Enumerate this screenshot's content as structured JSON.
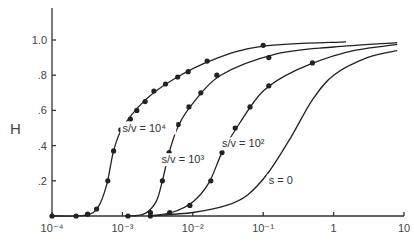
{
  "chart_data": {
    "type": "line",
    "title": "",
    "xlabel": "",
    "ylabel": "H",
    "xscale": "log",
    "xlim": [
      0.0001,
      10
    ],
    "ylim": [
      0,
      1.15
    ],
    "grid": false,
    "legend": "inline curve labels",
    "x_ticks": [
      "10⁻⁴",
      "10⁻³",
      "10⁻²",
      "10⁻¹",
      "1",
      "10"
    ],
    "y_ticks": [
      ".2",
      ".4",
      ".6",
      ".8",
      "1.0"
    ],
    "series": [
      {
        "name": "s/v = 10⁴",
        "label": "s/v = 10⁴",
        "markers": true,
        "points": [
          [
            0.0001,
            0.0
          ],
          [
            0.00022,
            0.0
          ],
          [
            0.00032,
            0.01
          ],
          [
            0.00043,
            0.04
          ],
          [
            0.00062,
            0.2
          ],
          [
            0.00075,
            0.37
          ],
          [
            0.00095,
            0.49
          ],
          [
            0.0013,
            0.55
          ],
          [
            0.0016,
            0.6
          ],
          [
            0.0021,
            0.65
          ],
          [
            0.0028,
            0.71
          ],
          [
            0.0041,
            0.75
          ],
          [
            0.0061,
            0.79
          ],
          [
            0.0086,
            0.82
          ],
          [
            0.016,
            0.88
          ],
          [
            0.1,
            0.97
          ]
        ],
        "line": [
          [
            0.0001,
            0.0
          ],
          [
            0.0003,
            0.005
          ],
          [
            0.00045,
            0.05
          ],
          [
            0.0006,
            0.18
          ],
          [
            0.00075,
            0.37
          ],
          [
            0.001,
            0.5
          ],
          [
            0.002,
            0.65
          ],
          [
            0.005,
            0.77
          ],
          [
            0.02,
            0.89
          ],
          [
            0.1,
            0.965
          ],
          [
            1.5,
            0.99
          ]
        ]
      },
      {
        "name": "s/v = 10³",
        "label": "s/v = 10³",
        "markers": true,
        "points": [
          [
            0.0012,
            0.0
          ],
          [
            0.0025,
            0.02
          ],
          [
            0.0037,
            0.2
          ],
          [
            0.0046,
            0.36
          ],
          [
            0.0062,
            0.52
          ],
          [
            0.0088,
            0.62
          ],
          [
            0.013,
            0.7
          ],
          [
            0.022,
            0.8
          ],
          [
            0.12,
            0.9
          ]
        ],
        "line": [
          [
            0.0011,
            0.0
          ],
          [
            0.002,
            0.01
          ],
          [
            0.003,
            0.08
          ],
          [
            0.0037,
            0.2
          ],
          [
            0.0046,
            0.36
          ],
          [
            0.0062,
            0.51
          ],
          [
            0.01,
            0.64
          ],
          [
            0.025,
            0.8
          ],
          [
            0.15,
            0.92
          ],
          [
            1.0,
            0.96
          ],
          [
            8.0,
            0.985
          ]
        ]
      },
      {
        "name": "s/v = 10²",
        "label": "s/v = 10²",
        "markers": true,
        "points": [
          [
            0.0025,
            0.0
          ],
          [
            0.0047,
            0.02
          ],
          [
            0.0091,
            0.06
          ],
          [
            0.018,
            0.2
          ],
          [
            0.026,
            0.36
          ],
          [
            0.04,
            0.5
          ],
          [
            0.065,
            0.62
          ],
          [
            0.12,
            0.74
          ],
          [
            0.5,
            0.87
          ]
        ],
        "line": [
          [
            0.0023,
            0.0
          ],
          [
            0.005,
            0.02
          ],
          [
            0.01,
            0.08
          ],
          [
            0.017,
            0.19
          ],
          [
            0.026,
            0.36
          ],
          [
            0.045,
            0.52
          ],
          [
            0.1,
            0.71
          ],
          [
            0.3,
            0.83
          ],
          [
            1.5,
            0.93
          ],
          [
            8.0,
            0.975
          ]
        ]
      },
      {
        "name": "s = 0",
        "label": "s = 0",
        "markers": false,
        "points": [],
        "line": [
          [
            0.0025,
            0.0
          ],
          [
            0.01,
            0.02
          ],
          [
            0.03,
            0.06
          ],
          [
            0.06,
            0.12
          ],
          [
            0.12,
            0.25
          ],
          [
            0.25,
            0.45
          ],
          [
            0.5,
            0.66
          ],
          [
            1.0,
            0.8
          ],
          [
            3.0,
            0.9
          ],
          [
            8.0,
            0.94
          ]
        ]
      }
    ],
    "annotations": [
      {
        "text": "s/v = 10⁴",
        "x": 0.001,
        "y": 0.48
      },
      {
        "text": "s/v = 10³",
        "x": 0.0036,
        "y": 0.3
      },
      {
        "text": "s/v = 10²",
        "x": 0.026,
        "y": 0.39
      },
      {
        "text": "s = 0",
        "x": 0.12,
        "y": 0.18
      }
    ]
  }
}
